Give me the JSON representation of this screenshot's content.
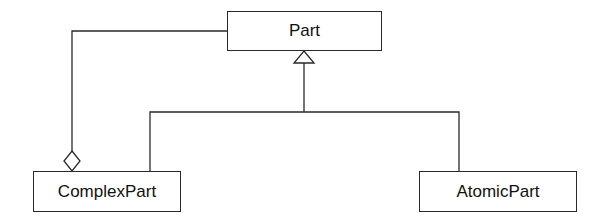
{
  "diagram": {
    "type": "uml-class-diagram",
    "colors": {
      "line": "#2a2a2a",
      "background": "#ffffff",
      "text": "#111111"
    },
    "classes": [
      {
        "id": "part",
        "name": "Part"
      },
      {
        "id": "complex",
        "name": "ComplexPart"
      },
      {
        "id": "atomic",
        "name": "AtomicPart"
      }
    ],
    "relationships": [
      {
        "type": "generalization",
        "from": "ComplexPart",
        "to": "Part",
        "marker": "hollow-triangle"
      },
      {
        "type": "generalization",
        "from": "AtomicPart",
        "to": "Part",
        "marker": "hollow-triangle"
      },
      {
        "type": "aggregation",
        "whole": "ComplexPart",
        "part": "Part",
        "marker": "hollow-diamond"
      }
    ]
  }
}
